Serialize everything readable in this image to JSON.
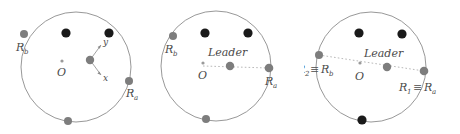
{
  "figure": {
    "title": "",
    "colors": {
      "circle_stroke": "#8c8c8c",
      "node_black": "#1a1a1a",
      "node_gray": "#7d7d7d",
      "center_dot": "#9a9a9a",
      "dotted_line": "#b0b0b0",
      "label_text": "#4a4a4a",
      "axis_arrow": "#8a8a8a",
      "background": "#ffffff"
    }
  },
  "panels": [
    {
      "id": "panel-1",
      "name": "initial-configuration",
      "center_label": "O",
      "leader_label": "",
      "axis_x_label": "x",
      "axis_y_label": "y",
      "boundary_labels": {
        "left": "R",
        "left_sub": "b",
        "right": "R",
        "right_sub": "a",
        "left_full": "R_b",
        "right_full": "R_a"
      },
      "nodes": [
        {
          "name": "boundary-node-left",
          "cx": 24,
          "cy": 34,
          "r": 4.0,
          "color": "#7d7d7d"
        },
        {
          "name": "interior-node-1",
          "cx": 66,
          "cy": 33,
          "r": 4.6,
          "color": "#1a1a1a"
        },
        {
          "name": "interior-node-2",
          "cx": 109,
          "cy": 33,
          "r": 4.6,
          "color": "#1a1a1a"
        },
        {
          "name": "boundary-node-right",
          "cx": 129,
          "cy": 81,
          "r": 4.0,
          "color": "#7d7d7d"
        },
        {
          "name": "boundary-node-bottom",
          "cx": 68,
          "cy": 121,
          "r": 4.0,
          "color": "#7d7d7d"
        },
        {
          "name": "leader-node",
          "cx": 90,
          "cy": 60,
          "r": 4.2,
          "color": "#7d7d7d"
        }
      ]
    },
    {
      "id": "panel-2",
      "name": "leader-designated",
      "center_label": "O",
      "leader_label": "Leader",
      "axis_x_label": "",
      "axis_y_label": "",
      "boundary_labels": {
        "left": "R",
        "left_sub": "b",
        "right": "R",
        "right_sub": "a",
        "left_full": "R_b",
        "right_full": "R_a"
      },
      "nodes": [
        {
          "name": "boundary-node-left",
          "cx": 21,
          "cy": 36,
          "r": 4.0,
          "color": "#7d7d7d"
        },
        {
          "name": "interior-node-1",
          "cx": 53,
          "cy": 33,
          "r": 4.6,
          "color": "#1a1a1a"
        },
        {
          "name": "interior-node-2",
          "cx": 96,
          "cy": 33,
          "r": 4.6,
          "color": "#1a1a1a"
        },
        {
          "name": "boundary-node-right",
          "cx": 117,
          "cy": 68,
          "r": 4.3,
          "color": "#7d7d7d"
        },
        {
          "name": "boundary-node-bottom",
          "cx": 54,
          "cy": 119,
          "r": 4.0,
          "color": "#7d7d7d"
        },
        {
          "name": "leader-node",
          "cx": 78,
          "cy": 66,
          "r": 4.2,
          "color": "#7d7d7d"
        }
      ]
    },
    {
      "id": "panel-3",
      "name": "radii-aligned",
      "center_label": "O",
      "leader_label": "Leader",
      "axis_x_label": "",
      "axis_y_label": "",
      "equiv_symbol": "≡",
      "boundary_labels": {
        "left": "R",
        "left_sub": "2",
        "left_equiv": "R",
        "left_equiv_sub": "b",
        "right": "R",
        "right_sub": "1",
        "right_equiv": "R",
        "right_equiv_sub": "a",
        "left_full": "R_2 ≡ R_b",
        "right_full": "R_1 ≡ R_a"
      },
      "nodes": [
        {
          "name": "boundary-node-left",
          "cx": 15,
          "cy": 55,
          "r": 4.0,
          "color": "#7d7d7d"
        },
        {
          "name": "interior-node-1",
          "cx": 55,
          "cy": 33,
          "r": 4.6,
          "color": "#1a1a1a"
        },
        {
          "name": "interior-node-2",
          "cx": 98,
          "cy": 34,
          "r": 4.6,
          "color": "#1a1a1a"
        },
        {
          "name": "boundary-node-right",
          "cx": 120,
          "cy": 71,
          "r": 4.3,
          "color": "#7d7d7d"
        },
        {
          "name": "boundary-node-bottom",
          "cx": 58,
          "cy": 120,
          "r": 4.6,
          "color": "#1a1a1a"
        },
        {
          "name": "leader-node",
          "cx": 83,
          "cy": 67,
          "r": 4.2,
          "color": "#7d7d7d"
        }
      ]
    }
  ]
}
